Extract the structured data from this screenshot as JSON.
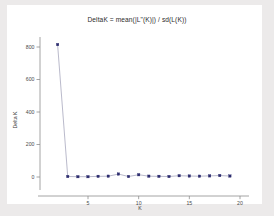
{
  "chart_data": {
    "type": "line",
    "title": "DeltaK = mean(|L\"(K)|) / sd(L(K))",
    "xlabel": "K",
    "ylabel": "Delta K",
    "x": [
      2,
      3,
      4,
      5,
      6,
      7,
      8,
      9,
      10,
      11,
      12,
      13,
      14,
      15,
      16,
      17,
      18,
      19
    ],
    "values": [
      815,
      3,
      2,
      2,
      4,
      5,
      18,
      3,
      14,
      5,
      4,
      3,
      8,
      6,
      5,
      7,
      9,
      6
    ],
    "series": [
      {
        "name": "Delta K",
        "values": [
          815,
          3,
          2,
          2,
          4,
          5,
          18,
          3,
          14,
          5,
          4,
          3,
          8,
          6,
          5,
          7,
          9,
          6
        ]
      }
    ],
    "xlim": [
      1.5,
      20.5
    ],
    "ylim": [
      -25,
      860
    ],
    "xticks": [
      5,
      10,
      15,
      20
    ],
    "xticklabels": [
      "5",
      "10",
      "15",
      "20"
    ],
    "yticks": [
      0,
      200,
      400,
      600,
      800
    ],
    "yticklabels": [
      "0",
      "200",
      "400",
      "600",
      "800"
    ],
    "grid": false,
    "legend": false,
    "marker": "square",
    "line_color": "#9c9cb4",
    "marker_color": "#2c2c6e",
    "panel_color": "#ffffff",
    "background_color": "#eceaea"
  }
}
